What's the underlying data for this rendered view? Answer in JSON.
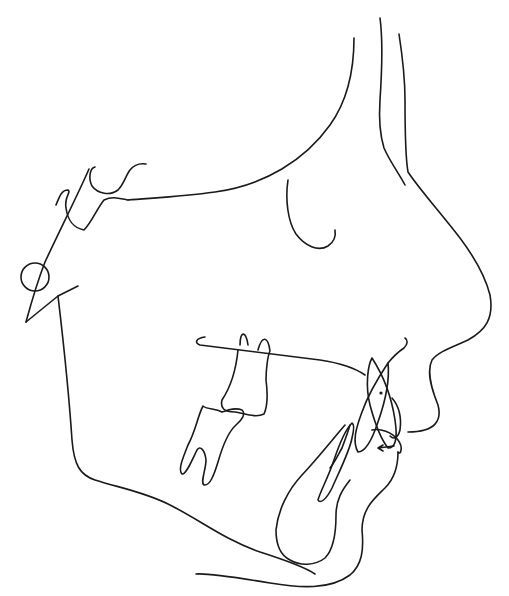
{
  "diagram": {
    "type": "lateral cephalometric tracing",
    "background": "#ffffff",
    "stroke_color": "#1a1a1a",
    "structures": [
      {
        "id": "soft-tissue-forehead",
        "label": "Soft tissue profile: forehead/nose"
      },
      {
        "id": "frontal-bone",
        "label": "Frontal bone"
      },
      {
        "id": "cranial-base",
        "label": "Anterior cranial base / sella"
      },
      {
        "id": "orbit",
        "label": "Orbit"
      },
      {
        "id": "porion",
        "label": "Porion (ear rod ring)"
      },
      {
        "id": "mandible-ramus",
        "label": "Mandibular ramus and lower border"
      },
      {
        "id": "palatal-plane",
        "label": "Palatal plane"
      },
      {
        "id": "upper-molar",
        "label": "Upper first molar"
      },
      {
        "id": "lower-molar",
        "label": "Lower first molar"
      },
      {
        "id": "upper-incisor",
        "label": "Upper incisors"
      },
      {
        "id": "lower-incisor",
        "label": "Lower incisors"
      },
      {
        "id": "symphysis",
        "label": "Mandibular symphysis"
      },
      {
        "id": "soft-tissue-chin",
        "label": "Soft tissue lips and chin"
      },
      {
        "id": "overjet-arrow",
        "label": "Overjet arrow"
      }
    ]
  }
}
